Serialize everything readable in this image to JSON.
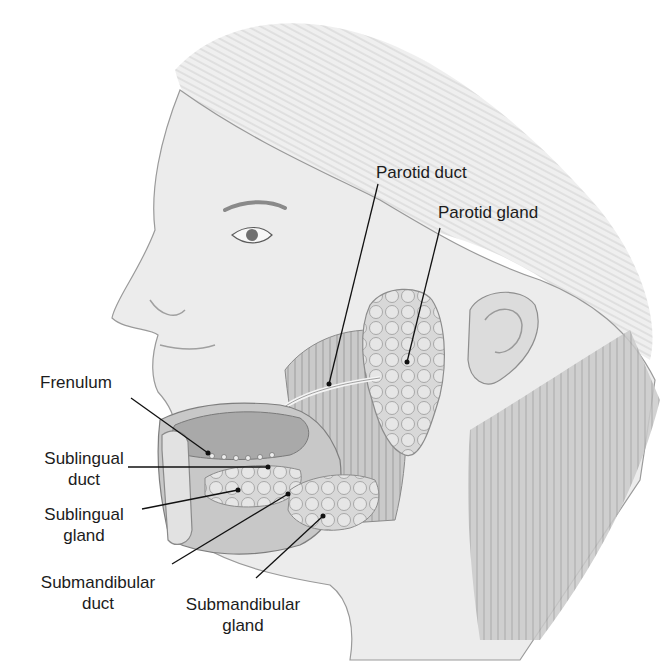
{
  "figure": {
    "labels": {
      "parotid_duct": "Parotid duct",
      "parotid_gland": "Parotid gland",
      "frenulum": "Frenulum",
      "sublingual_duct_1": "Sublingual",
      "sublingual_duct_2": "duct",
      "sublingual_gland_1": "Sublingual",
      "sublingual_gland_2": "gland",
      "submandibular_duct_1": "Submandibular",
      "submandibular_duct_2": "duct",
      "submandibular_gland_1": "Submandibular",
      "submandibular_gland_2": "gland"
    },
    "colors": {
      "background": "#ffffff",
      "skin": "#e9e9e9",
      "shadow": "#bdbdbd",
      "gland": "#d4d4d4",
      "muscle": "#c4c4c4",
      "tongue": "#a9a9a9",
      "leader_line": "#111111",
      "text": "#1c1c1c"
    }
  }
}
